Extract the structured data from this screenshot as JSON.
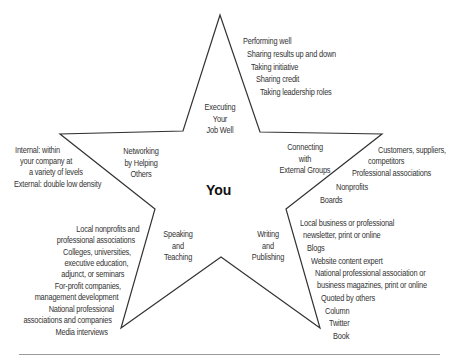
{
  "diagram": {
    "center_label": "You",
    "star_stroke_color": "#333333",
    "rule_color": "#9a9a9a",
    "points": {
      "top": {
        "title": [
          "Executing",
          "Your",
          "Job Well"
        ],
        "items": [
          "Performing well",
          "Sharing results up and down",
          "Taking initiative",
          "Sharing credit",
          "Taking leadership roles"
        ]
      },
      "left": {
        "title": [
          "Networking",
          "by Helping",
          "Others"
        ],
        "items": [
          "Internal: within",
          "your company at",
          "a variety of levels",
          "External: double low density"
        ]
      },
      "right": {
        "title": [
          "Connecting",
          "with",
          "External Groups"
        ],
        "items": [
          "Customers, suppliers,",
          "competitors",
          "Professional associations",
          "Nonprofits",
          "Boards"
        ]
      },
      "bottom_left": {
        "title": [
          "Speaking",
          "and",
          "Teaching"
        ],
        "items": [
          "Local nonprofits and",
          "professional associations",
          "Colleges, universities,",
          "executive education,",
          "adjunct, or seminars",
          "For-profit companies,",
          "management development",
          "National professional",
          "associations and companies",
          "Media interviews"
        ]
      },
      "bottom_right": {
        "title": [
          "Writing",
          "and",
          "Publishing"
        ],
        "items": [
          "Local business or professional",
          "newsletter, print or online",
          "Blogs",
          "Website content expert",
          "National professional association or",
          "business magazines, print or online",
          "Quoted by others",
          "Column",
          "Twitter",
          "Book"
        ]
      }
    }
  }
}
